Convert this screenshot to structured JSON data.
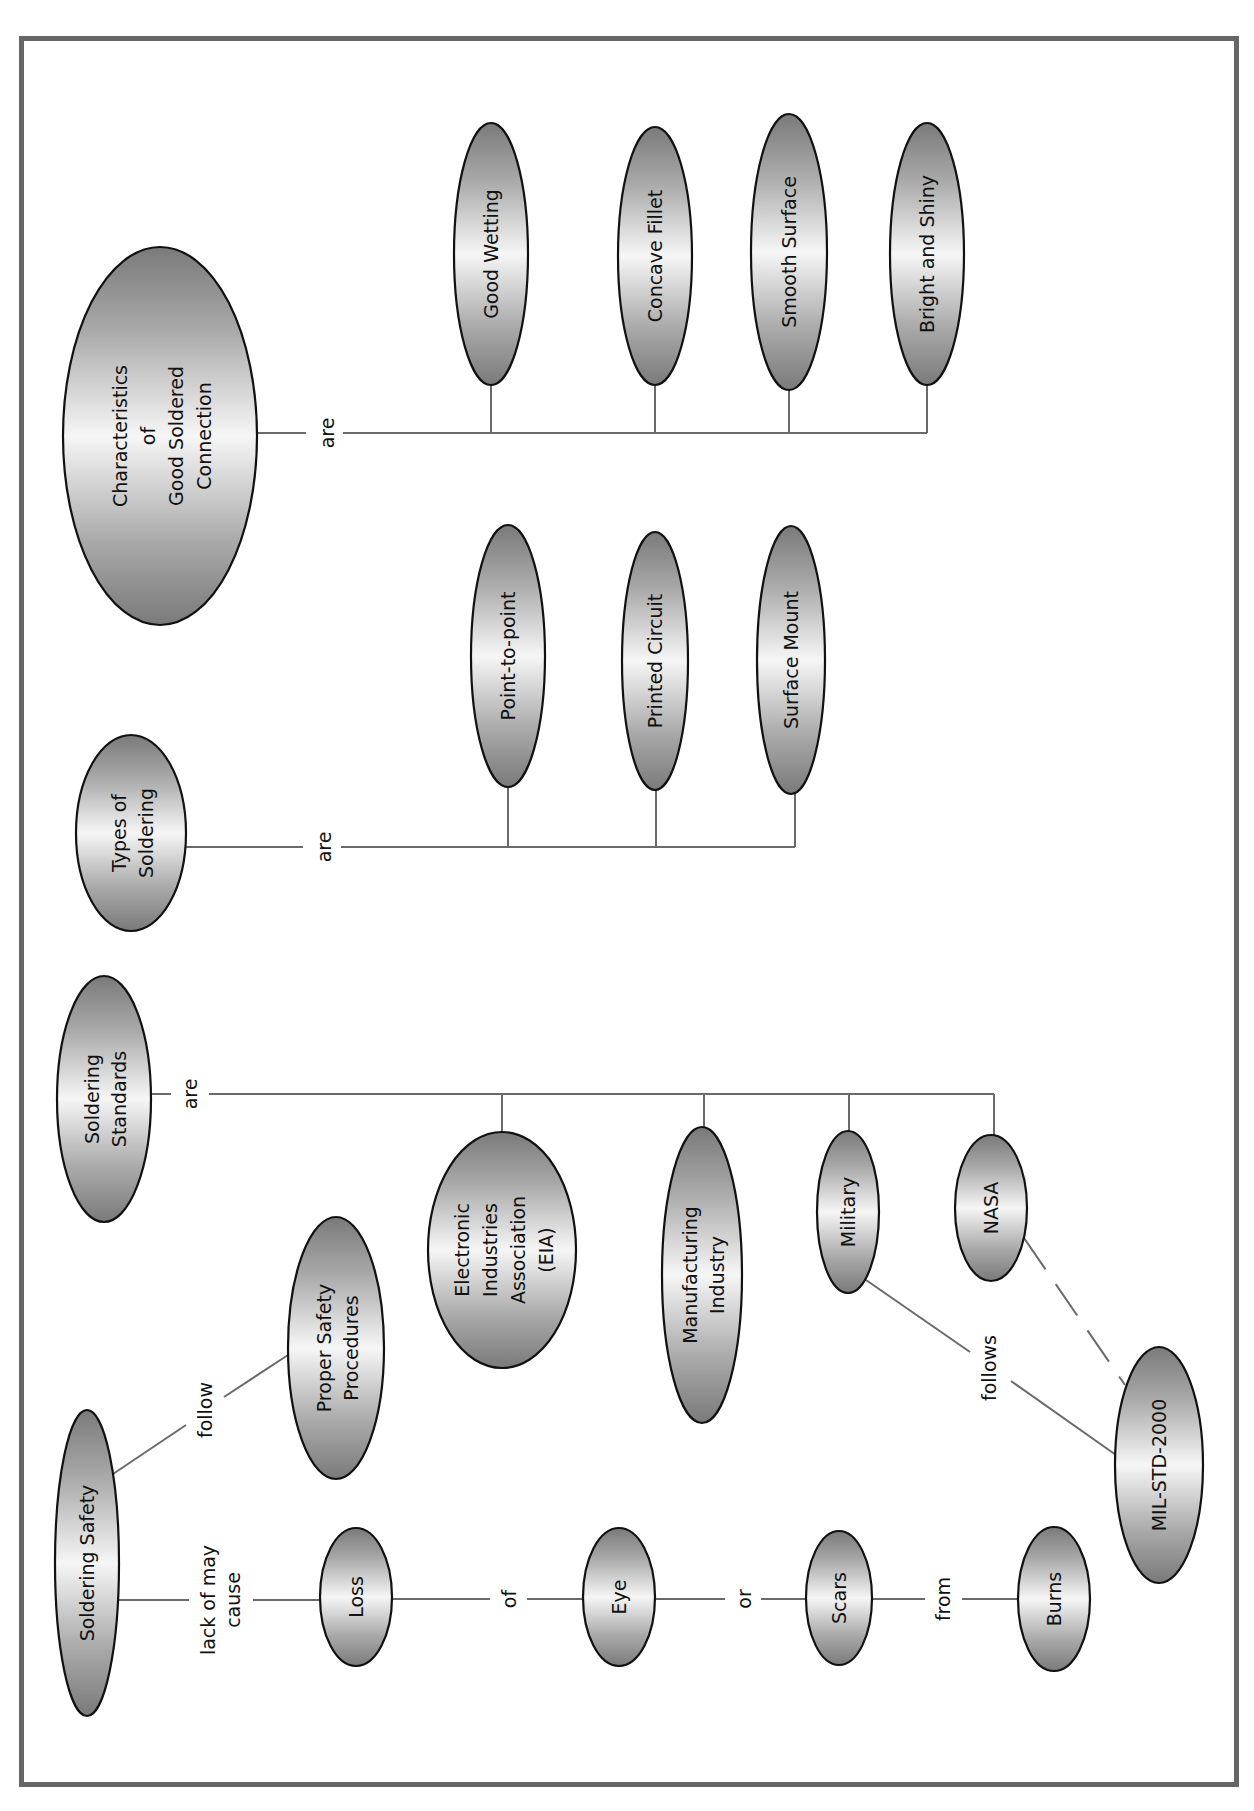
{
  "diagram": {
    "type": "concept-map",
    "orientation": "rotated-90-ccw",
    "colors": {
      "frame": "#666666",
      "node_dark": "#7d7d7d",
      "node_light": "#f4f4f4",
      "node_outline": "#111111",
      "link": "#6a6a6a",
      "text": "#111111"
    },
    "nodes": [
      {
        "id": "characteristics",
        "lines": [
          "Characteristics",
          "of",
          "Good Soldered",
          "Connection"
        ],
        "cx": 160,
        "cy": 436,
        "rx": 97,
        "ry": 189
      },
      {
        "id": "good_wetting",
        "lines": [
          "Good Wetting"
        ],
        "cx": 491,
        "cy": 254,
        "rx": 37,
        "ry": 131
      },
      {
        "id": "concave_fillet",
        "lines": [
          "Concave Fillet"
        ],
        "cx": 655,
        "cy": 256,
        "rx": 37,
        "ry": 129
      },
      {
        "id": "smooth_surface",
        "lines": [
          "Smooth Surface"
        ],
        "cx": 789,
        "cy": 252,
        "rx": 38,
        "ry": 138
      },
      {
        "id": "bright_and_shiny",
        "lines": [
          "Bright and Shiny"
        ],
        "cx": 927,
        "cy": 254,
        "rx": 37,
        "ry": 131
      },
      {
        "id": "types_of_soldering",
        "lines": [
          "Types of",
          "Soldering"
        ],
        "cx": 131,
        "cy": 833,
        "rx": 55,
        "ry": 98
      },
      {
        "id": "point_to_point",
        "lines": [
          "Point-to-point"
        ],
        "cx": 508,
        "cy": 656,
        "rx": 37,
        "ry": 131
      },
      {
        "id": "printed_circuit",
        "lines": [
          "Printed Circuit"
        ],
        "cx": 655,
        "cy": 661,
        "rx": 33,
        "ry": 129
      },
      {
        "id": "surface_mount",
        "lines": [
          "Surface Mount"
        ],
        "cx": 791,
        "cy": 660,
        "rx": 34,
        "ry": 134
      },
      {
        "id": "soldering_standards",
        "lines": [
          "Soldering",
          "Standards"
        ],
        "cx": 104,
        "cy": 1099,
        "rx": 47,
        "ry": 123
      },
      {
        "id": "eia",
        "lines": [
          "Electronic",
          "Industries",
          "Association",
          "(EIA)"
        ],
        "cx": 502,
        "cy": 1250,
        "rx": 74,
        "ry": 118
      },
      {
        "id": "manufacturing_industry",
        "lines": [
          "Manufacturing",
          "Industry"
        ],
        "cx": 702,
        "cy": 1275,
        "rx": 40,
        "ry": 148
      },
      {
        "id": "military",
        "lines": [
          "Military"
        ],
        "cx": 848,
        "cy": 1212,
        "rx": 31,
        "ry": 81
      },
      {
        "id": "nasa",
        "lines": [
          "NASA"
        ],
        "cx": 991,
        "cy": 1208,
        "rx": 36,
        "ry": 73
      },
      {
        "id": "proper_safety_procedures",
        "lines": [
          "Proper Safety",
          "Procedures"
        ],
        "cx": 336,
        "cy": 1348,
        "rx": 48,
        "ry": 131
      },
      {
        "id": "mil_std_2000",
        "lines": [
          "MIL-STD-2000"
        ],
        "cx": 1159,
        "cy": 1465,
        "rx": 44,
        "ry": 118
      },
      {
        "id": "soldering_safety",
        "lines": [
          "Soldering Safety"
        ],
        "cx": 87,
        "cy": 1563,
        "rx": 32,
        "ry": 153
      },
      {
        "id": "loss",
        "lines": [
          "Loss"
        ],
        "cx": 356,
        "cy": 1597,
        "rx": 36,
        "ry": 69
      },
      {
        "id": "eye",
        "lines": [
          "Eye"
        ],
        "cx": 619,
        "cy": 1597,
        "rx": 36,
        "ry": 69
      },
      {
        "id": "scars",
        "lines": [
          "Scars"
        ],
        "cx": 839,
        "cy": 1598,
        "rx": 33,
        "ry": 67
      },
      {
        "id": "burns",
        "lines": [
          "Burns"
        ],
        "cx": 1054,
        "cy": 1599,
        "rx": 36,
        "ry": 72
      }
    ],
    "links": [
      {
        "id": "char_are",
        "label": "are",
        "label_x": 327,
        "label_y": 433
      },
      {
        "id": "types_are",
        "label": "are",
        "label_x": 324,
        "label_y": 847
      },
      {
        "id": "standards_are",
        "label": "are",
        "label_x": 190,
        "label_y": 1094
      },
      {
        "id": "safety_follow",
        "label": "follow",
        "label_x": 205,
        "label_y": 1410
      },
      {
        "id": "safety_lack",
        "label_lines": [
          "lack of may",
          "cause"
        ],
        "label_x": 218,
        "label_y": 1600
      },
      {
        "id": "loss_of",
        "label": "of",
        "label_x": 509,
        "label_y": 1599
      },
      {
        "id": "eye_or",
        "label": "or",
        "label_x": 747,
        "label_y": 1599
      },
      {
        "id": "scars_from",
        "label": "from",
        "label_x": 942,
        "label_y": 1599
      },
      {
        "id": "military_follows",
        "label": "follows",
        "label_x": 989,
        "label_y": 1368
      }
    ]
  }
}
